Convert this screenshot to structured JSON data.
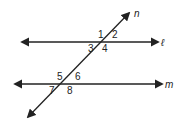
{
  "diagram": {
    "type": "parallel-lines-transversal",
    "colors": {
      "stroke": "#222222",
      "background": "#ffffff"
    },
    "lines": [
      {
        "id": "l",
        "label": "ℓ",
        "kind": "line",
        "from": [
          22,
          42
        ],
        "to": [
          158,
          42
        ],
        "label_pos": [
          161,
          46
        ]
      },
      {
        "id": "m",
        "label": "m",
        "kind": "line",
        "from": [
          15,
          84
        ],
        "to": [
          162,
          84
        ],
        "label_pos": [
          165,
          88
        ]
      },
      {
        "id": "n",
        "label": "n",
        "kind": "transversal",
        "from": [
          28,
          117
        ],
        "to": [
          129,
          13
        ],
        "label_pos": [
          134,
          17
        ]
      }
    ],
    "angles": [
      {
        "label": "1",
        "pos": [
          98,
          38
        ]
      },
      {
        "label": "2",
        "pos": [
          112,
          38
        ]
      },
      {
        "label": "3",
        "pos": [
          88,
          52
        ]
      },
      {
        "label": "4",
        "pos": [
          102,
          52
        ]
      },
      {
        "label": "5",
        "pos": [
          57,
          80
        ]
      },
      {
        "label": "6",
        "pos": [
          75,
          80
        ]
      },
      {
        "label": "7",
        "pos": [
          49,
          94
        ]
      },
      {
        "label": "8",
        "pos": [
          67,
          94
        ]
      }
    ]
  }
}
